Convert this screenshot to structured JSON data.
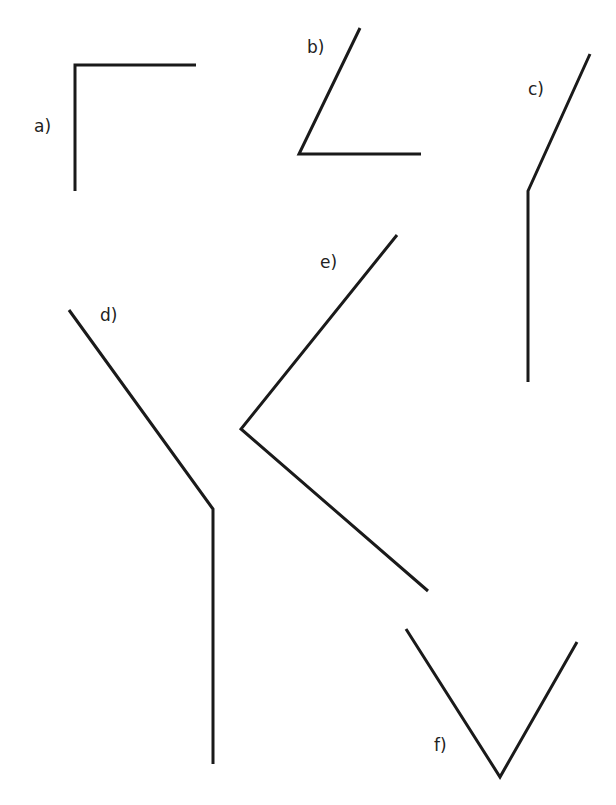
{
  "diagram": {
    "type": "angle-set",
    "line_color": "#1a1a1a",
    "angles": [
      {
        "id": "a",
        "label": "a)"
      },
      {
        "id": "b",
        "label": "b)"
      },
      {
        "id": "c",
        "label": "c)"
      },
      {
        "id": "d",
        "label": "d)"
      },
      {
        "id": "e",
        "label": "e)"
      },
      {
        "id": "f",
        "label": "f)"
      }
    ]
  }
}
